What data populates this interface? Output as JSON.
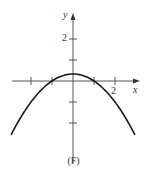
{
  "chart_data": {
    "type": "line",
    "title": "",
    "caption": "(F)",
    "xlabel": "x",
    "ylabel": "y",
    "x_tick_labels": [
      {
        "value": 2,
        "label": "2"
      }
    ],
    "y_tick_labels": [
      {
        "value": 2,
        "label": "2"
      }
    ],
    "x_ticks": [
      -2,
      -1,
      1,
      2
    ],
    "y_ticks": [
      -2,
      -1,
      1,
      2
    ],
    "xlim": [
      -3,
      3.2
    ],
    "ylim": [
      -3.9,
      3.2
    ],
    "grid": false,
    "legend": null,
    "series": [
      {
        "name": "parabola",
        "equation": "y = (1 - x^2)/3",
        "x": [
          -2.95,
          -2.5,
          -2,
          -1.5,
          -1,
          -0.5,
          0,
          0.5,
          1,
          1.5,
          2,
          2.5,
          2.95
        ],
        "y": [
          -2.57,
          -1.75,
          -1.0,
          -0.42,
          0.0,
          0.25,
          0.33,
          0.25,
          0.0,
          -0.42,
          -1.0,
          -1.75,
          -2.57
        ]
      }
    ]
  },
  "labels": {
    "x_axis": "x",
    "y_axis": "y",
    "x_tick_2": "2",
    "y_tick_2": "2",
    "caption": "(F)"
  },
  "colors": {
    "curve": "#1a1a1a",
    "axis": "#555555"
  }
}
